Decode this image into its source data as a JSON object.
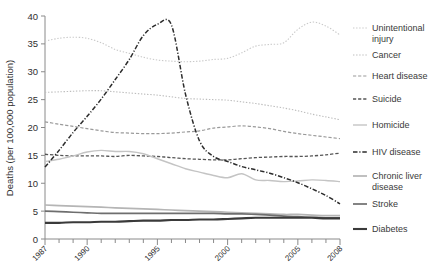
{
  "chart_data": {
    "type": "line",
    "title": "",
    "xlabel": "",
    "ylabel": "Deaths (per 100,000 population)",
    "ylim": [
      0,
      40
    ],
    "yticks": [
      0,
      5,
      10,
      15,
      20,
      25,
      30,
      35,
      40
    ],
    "ytick_labels": [
      "0",
      "5",
      "10",
      "15",
      "20",
      "25",
      "30",
      "35",
      "40"
    ],
    "xlim": [
      1987,
      2008
    ],
    "x": [
      1987,
      1988,
      1989,
      1990,
      1991,
      1992,
      1993,
      1994,
      1995,
      1996,
      1997,
      1998,
      1999,
      2000,
      2001,
      2002,
      2003,
      2004,
      2005,
      2006,
      2007,
      2008
    ],
    "xtick_labels": [
      "1987",
      "1990",
      "1995",
      "2000",
      "2005",
      "2008"
    ],
    "xtick_values": [
      1987,
      1990,
      1995,
      2000,
      2005,
      2008
    ],
    "grid": false,
    "legend_position": "right",
    "series": [
      {
        "name": "Unintentional injury",
        "style": "dotted",
        "color": "#c9c9c9",
        "width": 1.1,
        "values": [
          35.5,
          36.0,
          36.2,
          36.0,
          35.2,
          34.0,
          33.3,
          32.6,
          32.1,
          31.9,
          31.8,
          31.9,
          32.2,
          32.4,
          33.4,
          34.6,
          34.9,
          35.2,
          37.6,
          38.9,
          38.2,
          36.6
        ]
      },
      {
        "name": "Cancer",
        "style": "dotted",
        "color": "#bdbdbd",
        "width": 1.1,
        "values": [
          26.3,
          26.4,
          26.5,
          26.6,
          26.6,
          26.4,
          26.2,
          26.0,
          25.8,
          25.5,
          25.2,
          25.1,
          25.0,
          24.9,
          24.6,
          24.3,
          23.9,
          23.5,
          23.0,
          22.4,
          21.9,
          21.4
        ]
      },
      {
        "name": "Heart disease",
        "style": "dashed",
        "color": "#9a9a9a",
        "width": 1.2,
        "values": [
          21.0,
          20.6,
          20.2,
          19.8,
          19.4,
          19.1,
          19.0,
          18.9,
          18.9,
          19.0,
          19.2,
          19.4,
          19.9,
          20.1,
          20.3,
          20.1,
          19.8,
          19.3,
          18.9,
          18.6,
          18.3,
          18.0
        ]
      },
      {
        "name": "Suicide",
        "style": "dashed",
        "color": "#555555",
        "width": 1.3,
        "values": [
          15.2,
          15.0,
          14.9,
          14.9,
          14.9,
          14.8,
          15.0,
          14.9,
          14.8,
          14.6,
          14.4,
          14.3,
          14.2,
          14.2,
          14.4,
          14.6,
          14.7,
          14.8,
          14.8,
          14.9,
          15.1,
          15.4
        ]
      },
      {
        "name": "Homicide",
        "style": "solid",
        "color": "#c4c4c4",
        "width": 1.4,
        "values": [
          13.9,
          14.3,
          14.9,
          15.6,
          15.9,
          15.7,
          15.7,
          15.3,
          14.4,
          13.5,
          12.6,
          12.0,
          11.4,
          11.0,
          11.7,
          10.6,
          10.5,
          10.3,
          10.4,
          10.6,
          10.5,
          10.3
        ]
      },
      {
        "name": "HIV disease",
        "style": "dashdot",
        "color": "#2c2c2c",
        "width": 1.5,
        "values": [
          12.9,
          15.9,
          19.1,
          22.0,
          25.1,
          28.6,
          32.2,
          36.5,
          38.5,
          38.4,
          26.0,
          17.6,
          14.8,
          13.9,
          13.0,
          12.4,
          11.8,
          11.0,
          10.1,
          9.0,
          7.8,
          6.3
        ]
      },
      {
        "name": "Chronic liver disease",
        "style": "solid",
        "color": "#b5b5b5",
        "width": 1.7,
        "values": [
          6.1,
          6.0,
          5.9,
          5.8,
          5.7,
          5.6,
          5.5,
          5.4,
          5.3,
          5.2,
          5.1,
          5.0,
          4.9,
          4.8,
          4.7,
          4.6,
          4.5,
          4.4,
          4.4,
          4.3,
          4.2,
          4.2
        ]
      },
      {
        "name": "Stroke",
        "style": "solid",
        "color": "#6e6e6e",
        "width": 1.7,
        "values": [
          5.0,
          4.9,
          4.8,
          4.7,
          4.6,
          4.6,
          4.6,
          4.6,
          4.6,
          4.6,
          4.6,
          4.6,
          4.6,
          4.5,
          4.5,
          4.4,
          4.3,
          4.1,
          4.0,
          3.9,
          3.8,
          3.8
        ]
      },
      {
        "name": "Diabetes",
        "style": "solid",
        "color": "#3a3a3a",
        "width": 2.1,
        "values": [
          2.9,
          2.9,
          3.0,
          3.0,
          3.1,
          3.1,
          3.2,
          3.3,
          3.3,
          3.4,
          3.4,
          3.5,
          3.5,
          3.6,
          3.7,
          3.8,
          3.8,
          3.8,
          3.8,
          3.8,
          3.7,
          3.7
        ]
      }
    ]
  },
  "legend": {
    "items": [
      {
        "label": "Unintentional injury"
      },
      {
        "label": "Cancer"
      },
      {
        "label": "Heart disease"
      },
      {
        "label": "Suicide"
      },
      {
        "label": "Homicide"
      },
      {
        "label": "HIV disease"
      },
      {
        "label": "Chronic liver disease"
      },
      {
        "label": "Stroke"
      },
      {
        "label": "Diabetes"
      }
    ]
  }
}
